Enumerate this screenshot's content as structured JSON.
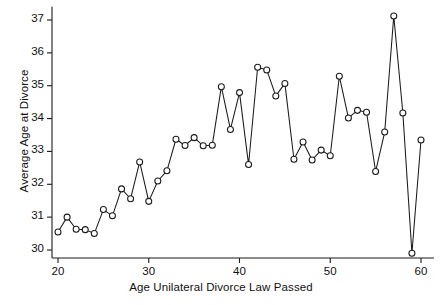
{
  "chart_data": {
    "type": "line",
    "title": "",
    "xlabel": "Age Unilateral Divorce Law Passed",
    "ylabel": "Average Age at Divorce",
    "xlim": [
      19,
      61
    ],
    "ylim": [
      29.6,
      37.4
    ],
    "xticks": [
      20,
      30,
      40,
      50,
      60
    ],
    "yticks": [
      30,
      31,
      32,
      33,
      34,
      35,
      36,
      37
    ],
    "grid": false,
    "legend": null,
    "marker": "open-circle",
    "x": [
      20,
      21,
      22,
      23,
      24,
      25,
      26,
      27,
      28,
      29,
      30,
      31,
      32,
      33,
      34,
      35,
      36,
      37,
      38,
      39,
      40,
      41,
      42,
      43,
      44,
      45,
      46,
      47,
      48,
      49,
      50,
      51,
      52,
      53,
      54,
      55,
      56,
      57,
      58,
      59,
      60
    ],
    "values": [
      30.55,
      31.0,
      30.63,
      30.62,
      30.5,
      31.23,
      31.04,
      31.86,
      31.56,
      32.68,
      31.48,
      32.1,
      32.41,
      33.37,
      33.18,
      33.42,
      33.17,
      33.19,
      34.97,
      33.67,
      34.79,
      32.6,
      35.56,
      35.48,
      34.69,
      35.07,
      32.76,
      33.29,
      32.74,
      33.04,
      32.87,
      35.29,
      34.02,
      34.25,
      34.19,
      32.39,
      33.59,
      37.12,
      34.17,
      29.9,
      33.35
    ]
  },
  "axes": {
    "xtick_labels": [
      "20",
      "30",
      "40",
      "50",
      "60"
    ],
    "ytick_labels": [
      "30",
      "31",
      "32",
      "33",
      "34",
      "35",
      "36",
      "37"
    ],
    "xlabel_text": "Age Unilateral Divorce Law Passed",
    "ylabel_text": "Average Age at Divorce"
  },
  "style": {
    "line_color": "#1a1a1a",
    "marker_fill": "#ffffff",
    "background": "#ffffff"
  }
}
